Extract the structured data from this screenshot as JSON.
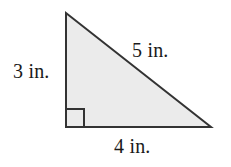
{
  "figure": {
    "type": "right-triangle-diagram",
    "shape_name": "right triangle",
    "fill_color": "#ebebeb",
    "stroke_color": "#333333",
    "background_color": "#ffffff",
    "stroke_width": 2,
    "vertices": {
      "apex": [
        66,
        13
      ],
      "right_angle": [
        66,
        127
      ],
      "base_right": [
        211,
        127
      ]
    },
    "right_angle_marker": {
      "name": "right-angle-square",
      "size": 18,
      "origin": [
        66,
        109
      ]
    },
    "labels": {
      "leg_vertical": "3 in.",
      "hypotenuse": "5 in.",
      "leg_horizontal": "4 in."
    },
    "measurements": {
      "vertical_leg": 3,
      "horizontal_leg": 4,
      "hypotenuse": 5,
      "unit": "in."
    }
  }
}
